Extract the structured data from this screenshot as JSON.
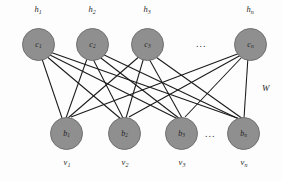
{
  "figure": {
    "type": "bipartite-neural-network-diagram",
    "node_fill": "#8f8f8f",
    "node_stroke": "#6f6f6f",
    "edge_color": "#1a1a1a"
  },
  "hidden_layer": {
    "outer_labels": [
      {
        "base": "h",
        "sub": "1"
      },
      {
        "base": "h",
        "sub": "2"
      },
      {
        "base": "h",
        "sub": "3"
      },
      {
        "base": "h",
        "sub": "n"
      }
    ],
    "nodes": [
      {
        "base": "c",
        "sub": "1"
      },
      {
        "base": "c",
        "sub": "2"
      },
      {
        "base": "c",
        "sub": "3"
      },
      {
        "base": "c",
        "sub": "n"
      }
    ],
    "ellipsis": "..."
  },
  "visible_layer": {
    "nodes": [
      {
        "base": "b",
        "sub": "1"
      },
      {
        "base": "b",
        "sub": "2"
      },
      {
        "base": "b",
        "sub": "3"
      },
      {
        "base": "b",
        "sub": "n"
      }
    ],
    "outer_labels": [
      {
        "base": "v",
        "sub": "1"
      },
      {
        "base": "v",
        "sub": "2"
      },
      {
        "base": "v",
        "sub": "3"
      },
      {
        "base": "v",
        "sub": "n"
      }
    ],
    "ellipsis": "..."
  },
  "weights": {
    "label": "W"
  }
}
